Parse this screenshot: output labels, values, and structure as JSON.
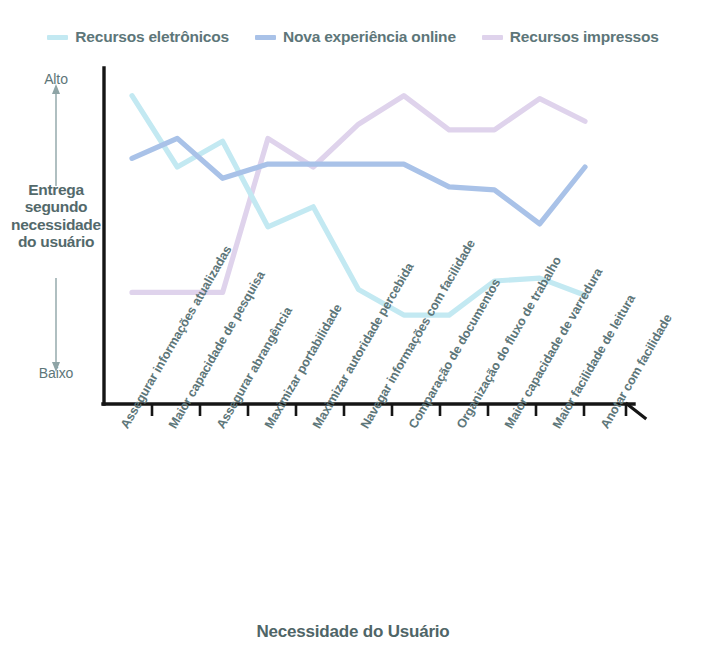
{
  "legend": {
    "position": "top-center",
    "items": [
      {
        "label": "Recursos eletrônicos",
        "color": "#c3e9f2",
        "key": "eletronicos"
      },
      {
        "label": "Nova experiência online",
        "color": "#a9c2e8",
        "key": "online"
      },
      {
        "label": "Recursos impressos",
        "color": "#dfd3ec",
        "key": "impressos"
      }
    ]
  },
  "axes": {
    "y_title": "Entrega segundo necessidade do usuário",
    "y_top_label": "Alto",
    "y_bottom_label": "Baixo",
    "x_title": "Necessidade do Usuário",
    "axis_color": "#1a1a1a"
  },
  "chart_data": {
    "type": "line",
    "title": "",
    "subtitle": "",
    "xlabel": "Necessidade do Usuário",
    "ylabel": "Entrega segundo necessidade do usuário",
    "ylim": [
      0,
      10
    ],
    "ytick_labels": [
      "Baixo",
      "Alto"
    ],
    "grid": false,
    "legend_position": "top-center",
    "categories": [
      "Assegurar informações atualizadas",
      "Maior capacidade de pesquisa",
      "Assegurar abrangência",
      "Maximizar portabilidade",
      "Maximizar autoridade percebida",
      "Navegar informações com facilidade",
      "Comparação de documentos",
      "Organização do fluxo de trabalho",
      "Maior capacidade de varredura",
      "Maior facilidade de leitura",
      "Anotar com facilidade"
    ],
    "series": [
      {
        "name": "Recursos eletrônicos",
        "color": "#c3e9f2",
        "values": [
          9.8,
          7.3,
          8.2,
          5.2,
          5.9,
          3.0,
          2.1,
          2.1,
          3.3,
          3.4,
          2.8
        ]
      },
      {
        "name": "Nova experiência online",
        "color": "#a9c2e8",
        "values": [
          7.6,
          8.3,
          6.9,
          7.4,
          7.4,
          7.4,
          7.4,
          6.6,
          6.5,
          5.3,
          7.3
        ]
      },
      {
        "name": "Recursos impressos",
        "color": "#dfd3ec",
        "values": [
          2.9,
          2.9,
          2.9,
          8.3,
          7.3,
          8.8,
          9.8,
          8.6,
          8.6,
          9.7,
          8.9
        ]
      }
    ]
  }
}
